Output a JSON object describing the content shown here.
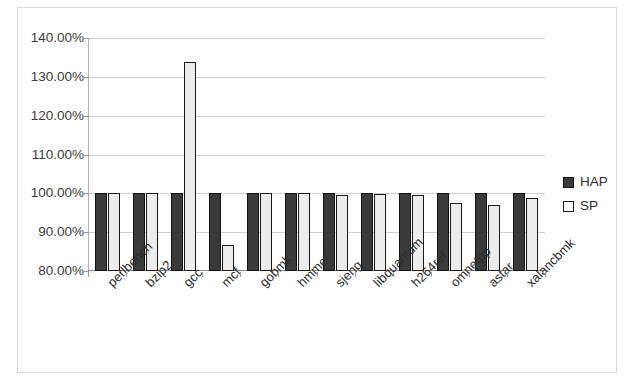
{
  "chart_data": {
    "type": "bar",
    "title": "",
    "subtitle": "",
    "xlabel": "",
    "ylabel": "",
    "ylim": [
      80,
      140
    ],
    "ytick_values": [
      140,
      130,
      120,
      110,
      100,
      90,
      80
    ],
    "ytick_labels": [
      "140.00%",
      "130.00%",
      "120.00%",
      "110.00%",
      "100.00%",
      "90.00%",
      "80.00%"
    ],
    "grid": true,
    "legend_position": "right",
    "categories": [
      "perlbench",
      "bzip2",
      "gcc",
      "mcf",
      "gobmk",
      "hmmer",
      "sjeng",
      "libquantum",
      "h264ref",
      "omnetpp",
      "astar",
      "xalancbmk"
    ],
    "series": [
      {
        "name": "HAP",
        "color": "#3a3a3a",
        "values": [
          100.0,
          100.0,
          100.0,
          100.0,
          100.0,
          100.0,
          100.0,
          100.0,
          100.0,
          100.0,
          100.0,
          100.0
        ]
      },
      {
        "name": "SP",
        "color": "#ececec",
        "values": [
          100.0,
          100.0,
          133.7,
          86.6,
          100.0,
          100.0,
          99.7,
          99.8,
          99.5,
          97.6,
          96.9,
          98.9
        ]
      }
    ]
  },
  "legend": {
    "entries": [
      {
        "label": "HAP",
        "swatch": "hap"
      },
      {
        "label": "SP",
        "swatch": "sp"
      }
    ]
  }
}
